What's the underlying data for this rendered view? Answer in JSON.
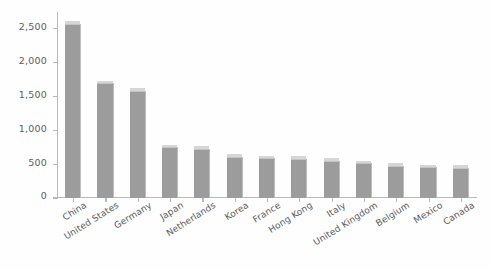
{
  "chart_data": {
    "type": "bar",
    "title": "",
    "subtitle": "",
    "xlabel": "",
    "ylabel": "$ billions",
    "ylim": [
      0,
      2750
    ],
    "yticks": [
      0,
      500,
      1000,
      1500,
      2000,
      2500
    ],
    "ytick_labels": [
      "0",
      "500",
      "1,000",
      "1,500",
      "2,000",
      "2,500"
    ],
    "grid": false,
    "legend": null,
    "bar_color": "#9c9c9c",
    "bar_top_color": "#d6d6d6",
    "axis_color": "#b9b9b9",
    "categories": [
      "China",
      "United States",
      "Germany",
      "Japan",
      "Netherlands",
      "Korea",
      "France",
      "Hong Kong",
      "Italy",
      "United Kingdom",
      "Belgium",
      "Mexico",
      "Canada"
    ],
    "values": [
      2570,
      1690,
      1580,
      745,
      723,
      604,
      582,
      570,
      546,
      510,
      468,
      450,
      440
    ]
  }
}
